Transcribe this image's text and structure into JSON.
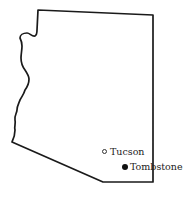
{
  "map": {
    "region": "Arizona",
    "outline_color": "#1a1a1a",
    "background": "#ffffff"
  },
  "places": [
    {
      "name": "Tucson",
      "marker": "open-circle"
    },
    {
      "name": "Tombstone",
      "marker": "filled-circle"
    }
  ]
}
